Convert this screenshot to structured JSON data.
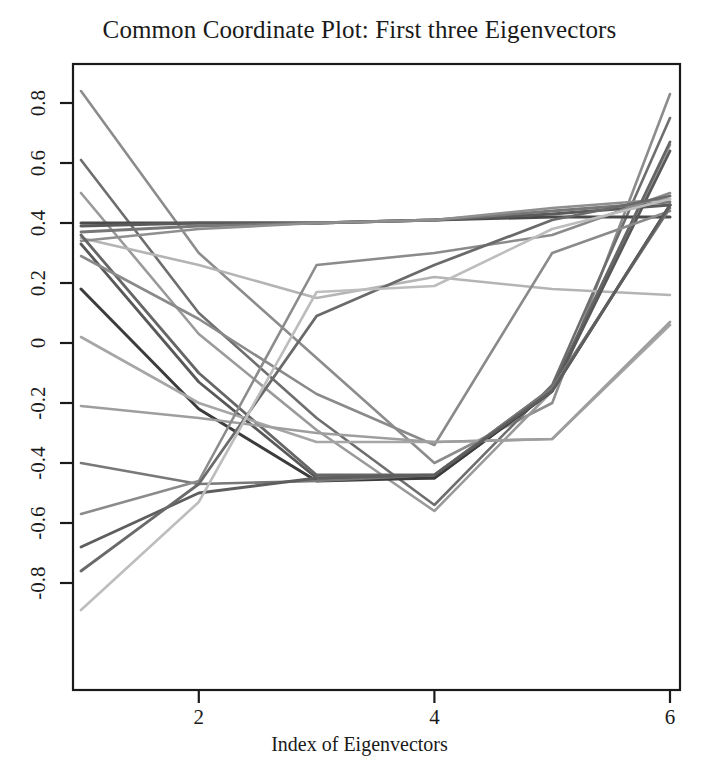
{
  "chart_data": {
    "type": "line",
    "title": "Common Coordinate Plot: First three Eigenvectors",
    "xlabel": "Index of Eigenvectors",
    "ylabel": "",
    "grid": false,
    "legend": "none",
    "x": [
      1,
      2,
      3,
      4,
      5,
      6
    ],
    "xlim": [
      0.78,
      6.22
    ],
    "ylim": [
      -0.93,
      0.9
    ],
    "xticks": [
      2,
      4,
      6
    ],
    "xtick_labels": [
      "2",
      "4",
      "6"
    ],
    "yticks": [
      0.8,
      0.6,
      0.4,
      0.2,
      0,
      -0.2,
      -0.4,
      -0.6,
      -0.8
    ],
    "ytick_labels": [
      "0.8",
      "0.6",
      "0.4",
      "0.2",
      "0",
      "-0.2",
      "-0.4",
      "-0.6",
      "-0.8"
    ],
    "series": [
      {
        "name": "ev-01",
        "color": "#8c8c8c",
        "width": 2.6,
        "values": [
          0.84,
          0.3,
          -0.05,
          -0.4,
          -0.2,
          0.83
        ]
      },
      {
        "name": "ev-02",
        "color": "#6e6e6e",
        "width": 2.6,
        "values": [
          0.61,
          0.1,
          -0.25,
          -0.54,
          -0.14,
          0.75
        ]
      },
      {
        "name": "ev-03",
        "color": "#9a9a9a",
        "width": 2.6,
        "values": [
          0.5,
          0.03,
          -0.29,
          -0.56,
          -0.16,
          0.66
        ]
      },
      {
        "name": "ev-04",
        "color": "#b4b4b4",
        "width": 2.6,
        "values": [
          0.35,
          0.26,
          0.15,
          0.22,
          0.18,
          0.16
        ]
      },
      {
        "name": "ev-05",
        "color": "#4a4a4a",
        "width": 3.0,
        "values": [
          0.4,
          0.4,
          0.4,
          0.41,
          0.42,
          0.42
        ]
      },
      {
        "name": "ev-06",
        "color": "#5a5a5a",
        "width": 3.0,
        "values": [
          0.39,
          0.4,
          0.4,
          0.41,
          0.43,
          0.46
        ]
      },
      {
        "name": "ev-07",
        "color": "#777777",
        "width": 2.8,
        "values": [
          0.37,
          0.39,
          0.4,
          0.41,
          0.44,
          0.47
        ]
      },
      {
        "name": "ev-08",
        "color": "#8f8f8f",
        "width": 2.6,
        "values": [
          0.34,
          0.38,
          0.4,
          0.41,
          0.45,
          0.48
        ]
      },
      {
        "name": "ev-09",
        "color": "#666666",
        "width": 2.8,
        "values": [
          0.36,
          -0.1,
          -0.44,
          -0.44,
          -0.15,
          0.67
        ]
      },
      {
        "name": "ev-10",
        "color": "#585858",
        "width": 2.8,
        "values": [
          0.33,
          -0.13,
          -0.45,
          -0.45,
          -0.16,
          0.64
        ]
      },
      {
        "name": "ev-11",
        "color": "#8a8a8a",
        "width": 2.6,
        "values": [
          0.29,
          0.08,
          -0.17,
          -0.34,
          0.3,
          0.44
        ]
      },
      {
        "name": "ev-12",
        "color": "#3c3c3c",
        "width": 3.0,
        "values": [
          0.18,
          -0.22,
          -0.46,
          -0.45,
          -0.16,
          0.46
        ]
      },
      {
        "name": "ev-13",
        "color": "#a6a6a6",
        "width": 2.6,
        "values": [
          0.02,
          -0.2,
          -0.33,
          -0.33,
          -0.32,
          0.06
        ]
      },
      {
        "name": "ev-14",
        "color": "#9e9e9e",
        "width": 2.6,
        "values": [
          -0.21,
          -0.25,
          -0.3,
          -0.33,
          -0.32,
          0.07
        ]
      },
      {
        "name": "ev-15",
        "color": "#787878",
        "width": 2.6,
        "values": [
          -0.4,
          -0.47,
          -0.46,
          -0.44,
          -0.15,
          0.45
        ]
      },
      {
        "name": "ev-16",
        "color": "#8b8b8b",
        "width": 2.6,
        "values": [
          -0.57,
          -0.46,
          0.26,
          0.3,
          0.36,
          0.5
        ]
      },
      {
        "name": "ev-17",
        "color": "#5e5e5e",
        "width": 2.8,
        "values": [
          -0.68,
          -0.5,
          -0.45,
          -0.44,
          -0.16,
          0.46
        ]
      },
      {
        "name": "ev-18",
        "color": "#6a6a6a",
        "width": 2.8,
        "values": [
          -0.76,
          -0.47,
          0.09,
          0.26,
          0.41,
          0.49
        ]
      },
      {
        "name": "ev-19",
        "color": "#bdbdbd",
        "width": 2.6,
        "values": [
          -0.89,
          -0.53,
          0.17,
          0.19,
          0.38,
          0.48
        ]
      }
    ]
  },
  "axes": {
    "frame_color": "#1a1a1a",
    "text_color": "#1a1a1a"
  }
}
